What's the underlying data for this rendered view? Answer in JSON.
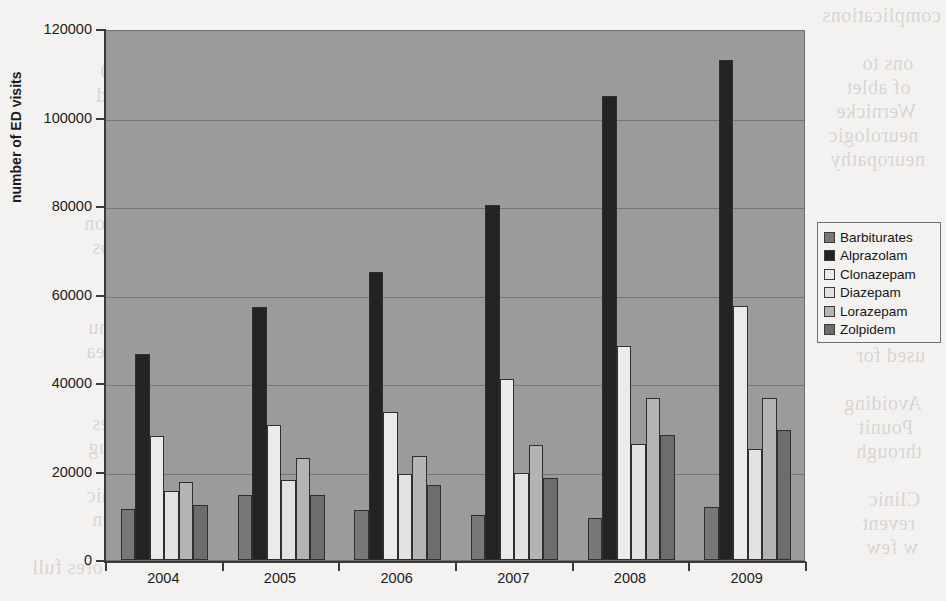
{
  "chart_data": {
    "type": "bar",
    "title": "",
    "xlabel": "",
    "ylabel": "number of ED visits",
    "categories": [
      "2004",
      "2005",
      "2006",
      "2007",
      "2008",
      "2009"
    ],
    "ylim": [
      0,
      120000
    ],
    "ytick_labels": [
      "0",
      "20000",
      "40000",
      "60000",
      "80000",
      "100000",
      "120000"
    ],
    "ytick_values": [
      0,
      20000,
      40000,
      60000,
      80000,
      100000,
      120000
    ],
    "grid": true,
    "legend_position": "right",
    "series": [
      {
        "name": "Barbiturates",
        "color": "#787878",
        "values": [
          11600,
          14600,
          11300,
          10200,
          9600,
          12000
        ]
      },
      {
        "name": "Alprazolam",
        "color": "#232323",
        "values": [
          46500,
          57200,
          65200,
          80300,
          104800,
          113000
        ]
      },
      {
        "name": "Clonazepam",
        "color": "#ebebeb",
        "values": [
          28000,
          30500,
          33500,
          40800,
          48400,
          57500
        ]
      },
      {
        "name": "Diazepam",
        "color": "#e2e2e2",
        "values": [
          15500,
          18000,
          19400,
          19600,
          26300,
          25200
        ]
      },
      {
        "name": "Lorazepam",
        "color": "#b4b4b4",
        "values": [
          17600,
          23000,
          23600,
          26100,
          36600,
          36700
        ]
      },
      {
        "name": "Zolpidem",
        "color": "#6d6d6d",
        "values": [
          12500,
          14700,
          17000,
          18600,
          28300,
          29300
        ]
      }
    ]
  },
  "plot": {
    "background_color": "#9b9b9b",
    "gridline_color": "#767676",
    "axis_color": "#3a3a3a",
    "page_background": "#f3f2f0"
  },
  "bleed_text": [
    {
      "text": "complications",
      "x": 822,
      "y": 4
    },
    {
      "text": "ons to",
      "x": 862,
      "y": 52
    },
    {
      "text": "of ablet",
      "x": 846,
      "y": 76
    },
    {
      "text": "Wernicke",
      "x": 836,
      "y": 100
    },
    {
      "text": "neurologic",
      "x": 828,
      "y": 124
    },
    {
      "text": "neuropathy",
      "x": 830,
      "y": 148
    },
    {
      "text": "version",
      "x": 848,
      "y": 220
    },
    {
      "text": "eeds",
      "x": 874,
      "y": 244
    },
    {
      "text": "while",
      "x": 872,
      "y": 320
    },
    {
      "text": "used for",
      "x": 856,
      "y": 344
    },
    {
      "text": "Avoiding",
      "x": 844,
      "y": 392
    },
    {
      "text": "Pounit",
      "x": 858,
      "y": 416
    },
    {
      "text": "through",
      "x": 856,
      "y": 440
    },
    {
      "text": "Clinic",
      "x": 868,
      "y": 488
    },
    {
      "text": "revent",
      "x": 862,
      "y": 512
    },
    {
      "text": "w few",
      "x": 866,
      "y": 536
    },
    {
      "text": "20",
      "x": 100,
      "y": 60
    },
    {
      "text": "ted",
      "x": 96,
      "y": 84
    },
    {
      "text": "usion",
      "x": 84,
      "y": 212
    },
    {
      "text": "mos",
      "x": 92,
      "y": 236
    },
    {
      "text": "minu",
      "x": 88,
      "y": 316
    },
    {
      "text": "a trea",
      "x": 86,
      "y": 340
    },
    {
      "text": "pries",
      "x": 92,
      "y": 412
    },
    {
      "text": "rroug",
      "x": 88,
      "y": 436
    },
    {
      "text": "Clinic",
      "x": 86,
      "y": 484
    },
    {
      "text": "aven",
      "x": 92,
      "y": 508
    },
    {
      "text": "ores full",
      "x": 32,
      "y": 556
    }
  ]
}
